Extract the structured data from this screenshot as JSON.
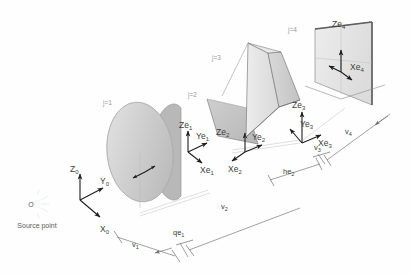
{
  "figure": {
    "type": "optical-system-diagram",
    "background": "#fefefe",
    "ink": "#3d3d3d"
  },
  "source": {
    "marker": "O",
    "label": "Source point"
  },
  "global_axes": {
    "name": "global-coordinate-triad",
    "z": {
      "base": "Z",
      "sub": "0"
    },
    "y": {
      "base": "Y",
      "sub": "0"
    },
    "x": {
      "base": "X",
      "sub": "0"
    }
  },
  "elements": [
    {
      "id": "j1",
      "tag": "j=1",
      "kind": "lens-disc",
      "axes": {
        "z": {
          "base": "Ze",
          "sub": "1"
        },
        "y": {
          "base": "Ye",
          "sub": "1"
        },
        "x": {
          "base": "Xe",
          "sub": "1"
        }
      }
    },
    {
      "id": "j2",
      "tag": "j=2",
      "kind": "flat-mirror",
      "axes": {
        "z": {
          "base": "Ze",
          "sub": "2"
        },
        "y": {
          "base": "Ye",
          "sub": "2"
        },
        "x": {
          "base": "Xe",
          "sub": "2"
        }
      }
    },
    {
      "id": "j3",
      "tag": "j=3",
      "kind": "prism",
      "axes": {
        "z": {
          "base": "Ze",
          "sub": "3"
        },
        "y": {
          "base": "Ye",
          "sub": "3"
        },
        "x": {
          "base": "Xe",
          "sub": "3"
        }
      }
    },
    {
      "id": "j4",
      "tag": "j=4",
      "kind": "detector-plane",
      "axes": {
        "z": {
          "base": "Ze",
          "sub": "4"
        },
        "x": {
          "base": "Xe",
          "sub": "4"
        }
      }
    }
  ],
  "dimensions": [
    {
      "id": "v1",
      "base": "v",
      "sub": "1"
    },
    {
      "id": "qe1",
      "base": "qe",
      "sub": "1"
    },
    {
      "id": "v2",
      "base": "v",
      "sub": "2"
    },
    {
      "id": "he2",
      "base": "he",
      "sub": "2"
    },
    {
      "id": "v3",
      "base": "v",
      "sub": "3"
    },
    {
      "id": "v4",
      "base": "v",
      "sub": "4"
    }
  ],
  "colors": {
    "disc_face": "#d2d2d2",
    "disc_rim": "#b4b4b4",
    "mirror_face": "#c4c4c4",
    "prism_face_light": "#e2e2e2",
    "prism_face_dark": "#cfcfcf",
    "screen_face": "#e8e8e8",
    "screen_edge": "#8c8c8c",
    "axis": "#1e1e1e",
    "dim": "#6e6e6e"
  }
}
